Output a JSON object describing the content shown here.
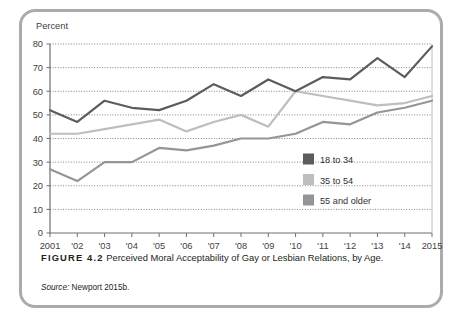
{
  "credit": "© Martin Rodgers/Stock Boston",
  "caption": {
    "figure_label": "FIGURE 4.2",
    "text": "Perceived Moral Acceptability of Gay or Lesbian Relations, by Age.",
    "source_prefix": "Source:",
    "source_text": "Newport 2015b."
  },
  "colors": {
    "series_18_34": "#5a5c5e",
    "series_35_54": "#bcbec0",
    "series_55_older": "#939598",
    "frame": "#a9abad",
    "axis": "#6d6f71",
    "grid": "#808285",
    "text": "#231f20"
  },
  "chart_data": {
    "type": "line",
    "title": "",
    "xlabel": "",
    "ylabel": "Percent",
    "ylim": [
      0,
      80
    ],
    "yticks": [
      0,
      10,
      20,
      30,
      40,
      50,
      60,
      70,
      80
    ],
    "ytick_labels": [
      "0",
      "10",
      "20",
      "30",
      "40",
      "50",
      "60",
      "70",
      "80"
    ],
    "grid": true,
    "grid_style": "dotted-horizontal",
    "legend_position": "inside-right-lower",
    "categories": [
      2001,
      2002,
      2003,
      2004,
      2005,
      2006,
      2007,
      2008,
      2009,
      2010,
      2011,
      2012,
      2013,
      2014,
      2015
    ],
    "xtick_labels": [
      "2001",
      "'02",
      "'03",
      "'04",
      "'05",
      "'06",
      "'07",
      "'08",
      "'09",
      "'10",
      "'11",
      "'12",
      "'13",
      "'14",
      "2015"
    ],
    "series": [
      {
        "name": "18 to 34",
        "color": "#5a5c5e",
        "values": [
          52,
          47,
          56,
          53,
          52,
          56,
          63,
          58,
          65,
          60,
          66,
          65,
          74,
          66,
          79
        ]
      },
      {
        "name": "35 to 54",
        "color": "#bcbec0",
        "values": [
          42,
          42,
          44,
          46,
          48,
          43,
          47,
          50,
          45,
          60,
          58,
          56,
          54,
          55,
          58
        ]
      },
      {
        "name": "55 and older",
        "color": "#939598",
        "values": [
          27,
          22,
          30,
          30,
          36,
          35,
          37,
          40,
          40,
          42,
          47,
          46,
          51,
          53,
          56
        ]
      }
    ]
  },
  "legend": [
    {
      "label": "18 to 34",
      "color": "#5a5c5e"
    },
    {
      "label": "35 to 54",
      "color": "#bcbec0"
    },
    {
      "label": "55 and older",
      "color": "#939598"
    }
  ]
}
